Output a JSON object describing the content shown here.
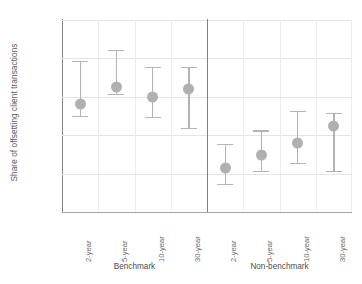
{
  "chart_data": {
    "type": "scatter",
    "title": "",
    "xlabel": "",
    "ylabel": "Share of offsetting client transactions",
    "ylim": [
      0,
      100
    ],
    "yticks": [
      "0%",
      "20%",
      "40%",
      "60%",
      "80%",
      "100%"
    ],
    "ytick_values": [
      0,
      20,
      40,
      60,
      80,
      100
    ],
    "grid": true,
    "legend": "none",
    "groups": [
      {
        "name": "Benchmark",
        "categories": [
          "2-year",
          "5-year",
          "10-year",
          "30-year"
        ],
        "values": [
          56,
          65,
          60,
          64
        ],
        "lower": [
          50,
          61.5,
          49.5,
          44
        ],
        "upper": [
          78.5,
          84.5,
          75.5,
          75.5
        ]
      },
      {
        "name": "Non-benchmark",
        "categories": [
          "2-year",
          "5-year",
          "10-year",
          "30-year"
        ],
        "values": [
          23,
          29.5,
          36,
          45
        ],
        "lower": [
          14.5,
          21.5,
          25.5,
          21.5
        ],
        "upper": [
          35.5,
          42.5,
          52.5,
          51.5
        ]
      }
    ],
    "marker_color": "#b0b0b0",
    "whisker_color": "#b3b3b3",
    "grid_color": "#e4e4e4",
    "axis_color": "#808080",
    "text_color": "#6b6b6b"
  }
}
